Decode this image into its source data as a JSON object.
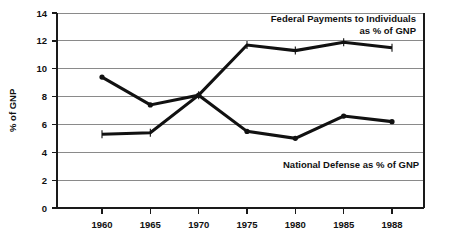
{
  "chart_data": {
    "type": "line",
    "title": "",
    "subtitle": "",
    "xlabel": "",
    "ylabel": "% of GNP",
    "categories": [
      "1960",
      "1965",
      "1970",
      "1975",
      "1980",
      "1985",
      "1988"
    ],
    "ylim": [
      0,
      14
    ],
    "ytick_values": [
      0,
      2,
      4,
      6,
      8,
      10,
      12,
      14
    ],
    "ytick_labels": [
      "0",
      "2",
      "4",
      "6",
      "8",
      "10",
      "12",
      "14"
    ],
    "grid": true,
    "grid_axis": "y",
    "legend_position": "inline-annotations",
    "series": [
      {
        "name": "Federal Payments to Individuals as % of GNP",
        "values": [
          5.3,
          5.4,
          8.1,
          11.7,
          11.3,
          11.9,
          11.5
        ],
        "color": "#111111",
        "marker": "tick"
      },
      {
        "name": "National Defense as % of GNP",
        "values": [
          9.4,
          7.4,
          8.1,
          5.5,
          5.0,
          6.6,
          6.2
        ],
        "color": "#111111",
        "marker": "dot"
      }
    ],
    "annotations": [
      {
        "id": "federal-annotation",
        "line1": "Federal Payments to Individuals",
        "line2": "as % of GNP"
      },
      {
        "id": "defense-annotation",
        "line1": "National Defense as % of GNP",
        "line2": ""
      }
    ]
  }
}
